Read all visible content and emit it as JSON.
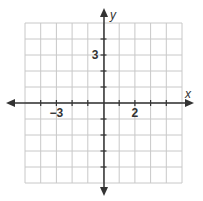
{
  "diagram": {
    "type": "coordinate-plane",
    "x_axis_label": "x",
    "y_axis_label": "y",
    "x_range": [
      -5,
      5
    ],
    "y_range": [
      -5,
      5
    ],
    "grid_step": 1,
    "tick_labels": {
      "x": [
        {
          "value": -3,
          "text": "−3"
        },
        {
          "value": 2,
          "text": "2"
        }
      ],
      "y": [
        {
          "value": 3,
          "text": "3"
        }
      ]
    },
    "colors": {
      "grid": "#c8c8c8",
      "axis": "#333333",
      "background": "#ffffff"
    }
  }
}
